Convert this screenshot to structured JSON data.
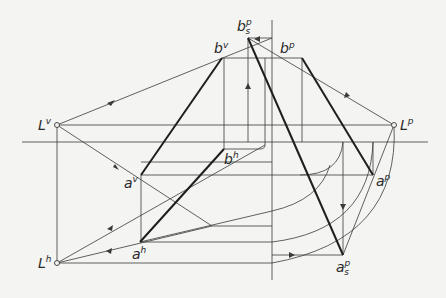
{
  "diagram": {
    "type": "descriptive-geometry-perspective-construction",
    "labels": {
      "Lv": {
        "base": "L",
        "sup": "v"
      },
      "Lp": {
        "base": "L",
        "sup": "p"
      },
      "Lh": {
        "base": "L",
        "sup": "h"
      },
      "bv": {
        "base": "b",
        "sup": "v"
      },
      "bp": {
        "base": "b",
        "sup": "p"
      },
      "bsp": {
        "base": "b",
        "sup": "p",
        "sub": "s"
      },
      "bh": {
        "base": "b",
        "sup": "h"
      },
      "av": {
        "base": "a",
        "sup": "v"
      },
      "ap": {
        "base": "a",
        "sup": "p"
      },
      "ah": {
        "base": "a",
        "sup": "h"
      },
      "asp": {
        "base": "a",
        "sup": "p",
        "sub": "s"
      }
    },
    "points": {
      "Lv": [
        57,
        125
      ],
      "Lp": [
        394,
        125
      ],
      "Lh": [
        57,
        263
      ],
      "bv": [
        222,
        58
      ],
      "bp": [
        302,
        58
      ],
      "bsp": [
        248,
        38
      ],
      "bh": [
        224,
        149
      ],
      "av": [
        141,
        175
      ],
      "ap": [
        373,
        175
      ],
      "ah": [
        140,
        242
      ],
      "asp": [
        343,
        255
      ]
    },
    "colors": {
      "background": "#f4f4f2",
      "line": "#3a3a3a",
      "bold_line": "#1e1e1e"
    }
  }
}
